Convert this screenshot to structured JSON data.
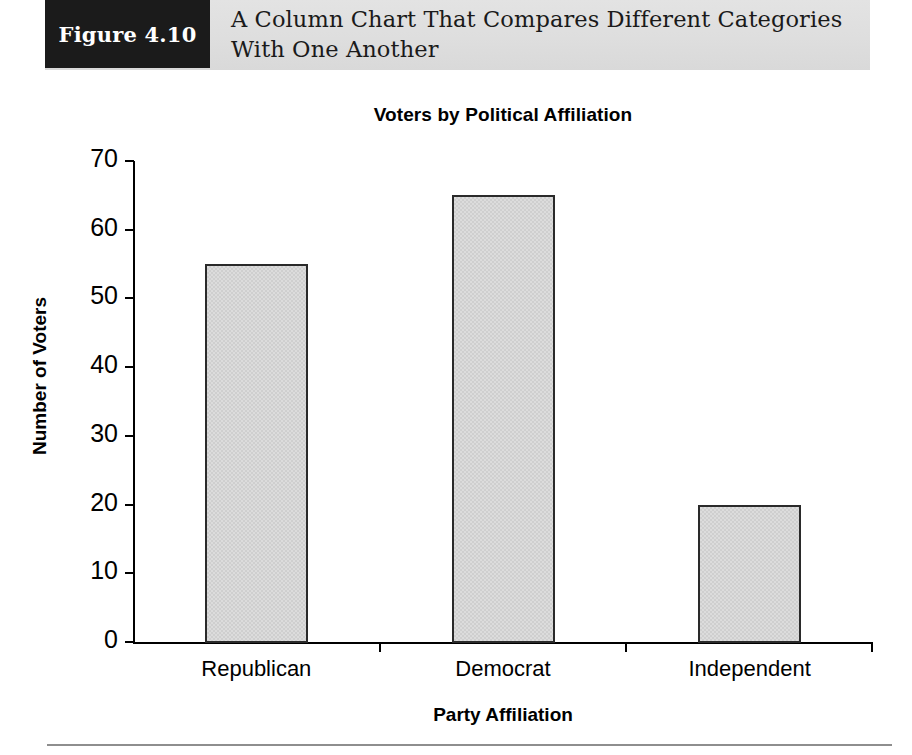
{
  "figure": {
    "number_label": "Figure 4.10",
    "caption": "A Column Chart That Compares Different Categories With One Another"
  },
  "chart_data": {
    "type": "bar",
    "title": "Voters by Political Affiliation",
    "xlabel": "Party Affiliation",
    "ylabel": "Number of Voters",
    "categories": [
      "Republican",
      "Democrat",
      "Independent"
    ],
    "values": [
      55,
      65,
      20
    ],
    "ylim": [
      0,
      70
    ],
    "yticks": [
      0,
      10,
      20,
      30,
      40,
      50,
      60,
      70
    ],
    "ytick_labels": [
      "0",
      "10",
      "20",
      "30",
      "40",
      "50",
      "60",
      "70"
    ],
    "grid": false,
    "legend": false,
    "bar_fill_color": "#dcdcdc",
    "bar_border_color": "#2a2a2a",
    "axis_color": "#000000"
  }
}
